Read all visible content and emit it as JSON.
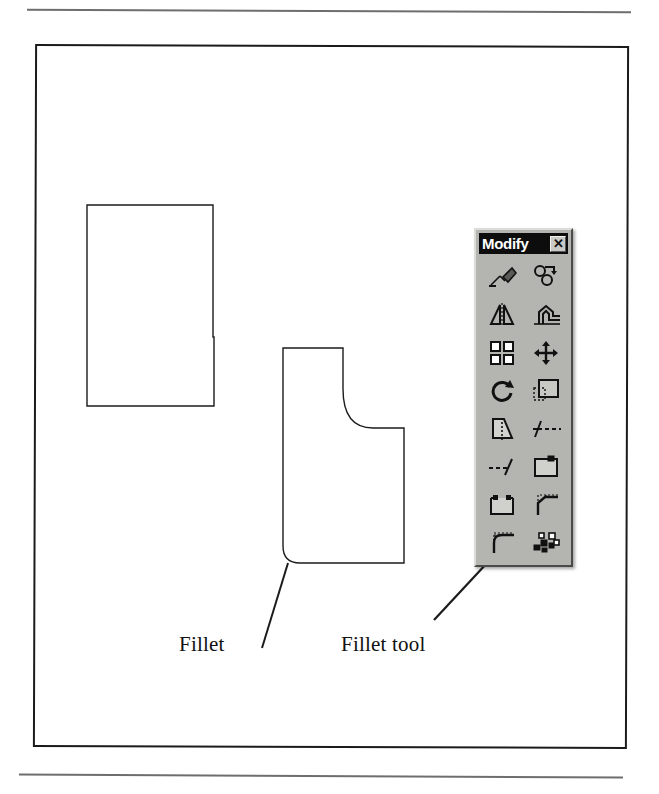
{
  "figure": {
    "labels": {
      "fillet": "Fillet",
      "fillet_tool": "Fillet tool"
    }
  },
  "toolbar": {
    "title": "Modify",
    "close_label": "✕",
    "background_color": "#b4b4b0",
    "titlebar_color": "#0d0d0d",
    "buttons": [
      {
        "name": "erase",
        "label": "Erase"
      },
      {
        "name": "copy",
        "label": "Copy Object"
      },
      {
        "name": "mirror",
        "label": "Mirror"
      },
      {
        "name": "offset",
        "label": "Offset"
      },
      {
        "name": "array",
        "label": "Array"
      },
      {
        "name": "move",
        "label": "Move"
      },
      {
        "name": "rotate",
        "label": "Rotate"
      },
      {
        "name": "scale",
        "label": "Scale"
      },
      {
        "name": "stretch",
        "label": "Stretch"
      },
      {
        "name": "trim",
        "label": "Trim"
      },
      {
        "name": "extend",
        "label": "Extend"
      },
      {
        "name": "break-at-point",
        "label": "Break at Point"
      },
      {
        "name": "break",
        "label": "Break"
      },
      {
        "name": "chamfer",
        "label": "Chamfer"
      },
      {
        "name": "fillet",
        "label": "Fillet"
      },
      {
        "name": "explode",
        "label": "Explode"
      }
    ]
  },
  "shapes": {
    "sharp_l": {
      "name": "L-shape with sharp corners",
      "stroke": "#1b1b1b"
    },
    "filleted_l": {
      "name": "L-shape with filleted (rounded) corners",
      "stroke": "#1b1b1b"
    }
  },
  "leaders": {
    "fillet_leader": {
      "from": [
        262,
        648
      ],
      "to": [
        288,
        563
      ]
    },
    "fillet_tool_leader": {
      "from": [
        434,
        620
      ],
      "to": [
        501,
        548
      ]
    }
  },
  "colors": {
    "line": "#1b1b1b",
    "rule": "#6e6e6e",
    "page": "#ffffff"
  }
}
